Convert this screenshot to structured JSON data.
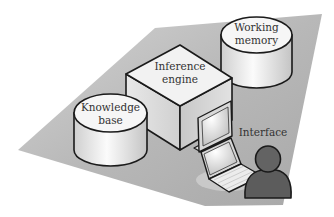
{
  "diagram": {
    "components": {
      "working_memory": {
        "line1": "Working",
        "line2": "memory",
        "shape": "cylinder-icon"
      },
      "inference_engine": {
        "line1": "Inference",
        "line2": "engine",
        "shape": "box-icon"
      },
      "knowledge_base": {
        "line1": "Knowledge",
        "line2": "base",
        "shape": "cylinder-icon"
      },
      "interface": {
        "label": "Interface",
        "icons": [
          "monitor-icon",
          "laptop-icon",
          "user-icon"
        ]
      }
    },
    "colors": {
      "platform": "#b5b5b5",
      "outline": "#1a1a1a",
      "cylinder_top": "#f5f5f5",
      "cylinder_side": "#e4e4e4",
      "user": "#5c5c5c",
      "label": "#333333"
    }
  }
}
